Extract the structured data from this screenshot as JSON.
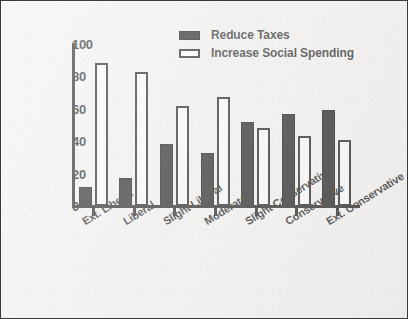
{
  "figure": {
    "background_color": "#f2f1f0",
    "border_color": "#3a3a3a",
    "series_dark_color": "#121212",
    "series_light_color": "#fbfbfa"
  },
  "legend": {
    "position": "top-center",
    "entries": [
      {
        "label": "Reduce Taxes",
        "swatch": "filled-black-rect-icon"
      },
      {
        "label": "Increase Social Spending",
        "swatch": "outlined-white-rect-icon"
      }
    ]
  },
  "yaxis": {
    "ticks": [
      "0",
      "20",
      "40",
      "60",
      "80",
      "100"
    ]
  },
  "chart_data": {
    "type": "bar",
    "title": "",
    "xlabel": "",
    "ylabel": "",
    "ylim": [
      0,
      100
    ],
    "grid": false,
    "legend_position": "top-center",
    "categories": [
      "Ext. Liberal",
      "Liberal",
      "Slight Liberal",
      "Moderate",
      "Slight Conservative",
      "Conservative",
      "Ext. Conservative"
    ],
    "series": [
      {
        "name": "Reduce Taxes",
        "color": "#121212",
        "values": [
          12,
          17,
          38,
          33,
          52,
          57,
          59
        ]
      },
      {
        "name": "Increase Social Spending",
        "color": "#fbfbfa",
        "values": [
          88,
          83,
          62,
          67,
          48,
          43,
          41
        ]
      }
    ],
    "yticks": [
      0,
      20,
      40,
      60,
      80,
      100
    ]
  }
}
